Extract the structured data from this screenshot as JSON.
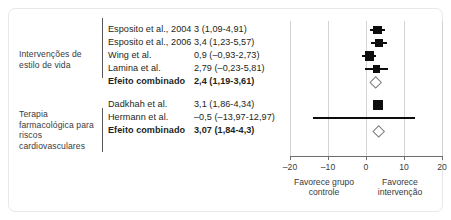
{
  "chart_data": {
    "type": "scatter",
    "subtype": "forest-plot",
    "title": "",
    "xlabel": "",
    "ylabel": "",
    "xlim": [
      -20,
      20
    ],
    "xticks": [
      -20,
      -10,
      0,
      10,
      20
    ],
    "xticklabels": [
      "–20",
      "–10",
      "0",
      "10",
      "20"
    ],
    "grid": true,
    "legend": "none",
    "axis_annotations": {
      "left": "Favorece grupo controle",
      "right": "Favorece intervenção"
    },
    "groups": [
      {
        "label": "Intervenções de estilo de vida",
        "rows": [
          {
            "study": "Esposito et al., 2004",
            "effect_text": "3 (1,09-4,91)",
            "estimate": 3,
            "ci_low": 1.09,
            "ci_high": 4.91,
            "marker": "square",
            "weight": 0.72
          },
          {
            "study": "Esposito et al., 2006",
            "effect_text": "3,4 (1,23-5,57)",
            "estimate": 3.4,
            "ci_low": 1.23,
            "ci_high": 5.57,
            "marker": "square",
            "weight": 0.7
          },
          {
            "study": "Wing et al.",
            "effect_text": "0,9 (–0,93-2,73)",
            "estimate": 0.9,
            "ci_low": -0.93,
            "ci_high": 2.73,
            "marker": "square",
            "weight": 0.8
          },
          {
            "study": "Lamina et al.",
            "effect_text": "2,79 (–0,23-5,81)",
            "estimate": 2.79,
            "ci_low": -0.23,
            "ci_high": 5.81,
            "marker": "square",
            "weight": 0.58
          },
          {
            "study": "Efeito combinado",
            "effect_text": "2,4 (1,19-3,61)",
            "estimate": 2.4,
            "ci_low": 1.19,
            "ci_high": 3.61,
            "marker": "diamond",
            "summary": true
          }
        ]
      },
      {
        "label": "Terapia farmacológica para riscos cardiovasculares",
        "rows": [
          {
            "study": "Dadkhah et al.",
            "effect_text": "3,1 (1,86-4,34)",
            "estimate": 3.1,
            "ci_low": 1.86,
            "ci_high": 4.34,
            "marker": "square",
            "weight": 1.0
          },
          {
            "study": "Hermann et al.",
            "effect_text": "–0,5 (–13,97-12,97)",
            "estimate": -0.5,
            "ci_low": -13.97,
            "ci_high": 12.97,
            "marker": "none",
            "weight": 0.0
          },
          {
            "study": "Efeito combinado",
            "effect_text": "3,07 (1,84-4,3)",
            "estimate": 3.07,
            "ci_low": 1.84,
            "ci_high": 4.3,
            "marker": "diamond",
            "summary": true
          }
        ]
      }
    ]
  },
  "colors": {
    "marker": "#0d0d0d",
    "diamond_stroke": "#7d7d80",
    "gridline": "#d3d3d6",
    "axis": "#6e6e71",
    "text": "#231f20",
    "border": "#e8e8ea"
  }
}
